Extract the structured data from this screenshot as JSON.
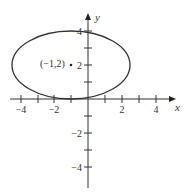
{
  "figure": {
    "x_axis_label": "x",
    "y_axis_label": "y",
    "x_ticks": [
      {
        "v": -4,
        "label": "−4"
      },
      {
        "v": -2,
        "label": "−2"
      },
      {
        "v": 2,
        "label": "2"
      },
      {
        "v": 4,
        "label": "4"
      }
    ],
    "y_ticks": [
      {
        "v": 4,
        "label": "4"
      },
      {
        "v": 2,
        "label": "2"
      },
      {
        "v": -2,
        "label": "−2"
      },
      {
        "v": -4,
        "label": "−4"
      }
    ],
    "center_label": "(−1,2)",
    "ellipse": {
      "center": [
        -1,
        2
      ],
      "semi_x": 3.5,
      "semi_y": 2
    },
    "line_color": "#333333"
  }
}
